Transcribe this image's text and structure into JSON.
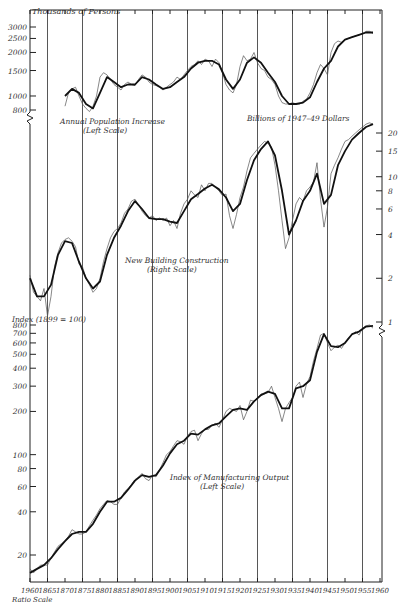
{
  "chart_data": {
    "type": "line",
    "title": "",
    "xlabel": "",
    "x_scale_note": "Ratio Scale",
    "x_ticks": [
      "1960",
      "1865",
      "1870",
      "1875",
      "1880",
      "1885",
      "1890",
      "1895",
      "1900",
      "1905",
      "1910",
      "1915",
      "1920",
      "1925",
      "1930",
      "1935",
      "1940",
      "1945",
      "1950",
      "1955",
      "1960"
    ],
    "xlim": [
      1860,
      1960
    ],
    "panels": [
      {
        "name": "Annual Population Increase",
        "label": "Annual Population Increase",
        "scale_note": "(Left Scale)",
        "axis": "left-top",
        "ylabel": "Thousands of Persons",
        "yscale": "log",
        "y_ticks": [
          "3000",
          "2500",
          "2000",
          "1500",
          "1000",
          "800"
        ],
        "series": [
          {
            "name": "annual",
            "x": [
              1870,
              1871,
              1872,
              1873,
              1874,
              1875,
              1876,
              1877,
              1878,
              1879,
              1880,
              1881,
              1882,
              1883,
              1884,
              1885,
              1886,
              1887,
              1888,
              1889,
              1890,
              1891,
              1892,
              1893,
              1894,
              1895,
              1896,
              1897,
              1898,
              1899,
              1900,
              1901,
              1902,
              1903,
              1904,
              1905,
              1906,
              1907,
              1908,
              1909,
              1910,
              1911,
              1912,
              1913,
              1914,
              1915,
              1916,
              1917,
              1918,
              1919,
              1920,
              1921,
              1922,
              1923,
              1924,
              1925,
              1926,
              1927,
              1928,
              1929,
              1930,
              1931,
              1932,
              1933,
              1934,
              1935,
              1936,
              1937,
              1938,
              1939,
              1940,
              1941,
              1942,
              1943,
              1944,
              1945,
              1946,
              1947,
              1948,
              1949,
              1950,
              1951,
              1952,
              1953,
              1954,
              1955,
              1956,
              1957,
              1958
            ],
            "values": [
              850,
              1050,
              1120,
              1150,
              1000,
              880,
              820,
              780,
              850,
              1000,
              1350,
              1450,
              1400,
              1300,
              1200,
              1150,
              1100,
              1200,
              1250,
              1200,
              1180,
              1300,
              1400,
              1350,
              1250,
              1200,
              1180,
              1150,
              1100,
              1150,
              1200,
              1250,
              1350,
              1300,
              1400,
              1500,
              1600,
              1650,
              1750,
              1650,
              1800,
              1750,
              1600,
              1800,
              1700,
              1450,
              1200,
              1100,
              1050,
              1200,
              1600,
              1900,
              1750,
              1800,
              2000,
              1700,
              1550,
              1500,
              1350,
              1300,
              1200,
              1000,
              900,
              880,
              880,
              900,
              880,
              880,
              920,
              950,
              1050,
              1200,
              1450,
              1650,
              1550,
              1400,
              2000,
              2300,
              2400,
              2350,
              2450,
              2500,
              2550,
              2600,
              2650,
              2700,
              2800,
              2800,
              2700
            ]
          },
          {
            "name": "smoothed",
            "x": [
              1870,
              1872,
              1874,
              1876,
              1878,
              1880,
              1882,
              1884,
              1886,
              1888,
              1890,
              1892,
              1894,
              1896,
              1898,
              1900,
              1902,
              1904,
              1906,
              1908,
              1910,
              1912,
              1914,
              1916,
              1918,
              1920,
              1922,
              1924,
              1926,
              1928,
              1930,
              1932,
              1934,
              1936,
              1938,
              1940,
              1942,
              1944,
              1946,
              1948,
              1950,
              1952,
              1954,
              1956,
              1958
            ],
            "values": [
              1000,
              1120,
              1050,
              880,
              820,
              1050,
              1350,
              1250,
              1150,
              1200,
              1200,
              1350,
              1300,
              1200,
              1120,
              1150,
              1250,
              1350,
              1550,
              1700,
              1750,
              1750,
              1650,
              1300,
              1120,
              1300,
              1700,
              1850,
              1700,
              1450,
              1250,
              1000,
              880,
              880,
              900,
              980,
              1250,
              1550,
              1750,
              2200,
              2450,
              2550,
              2650,
              2750,
              2750
            ]
          }
        ]
      },
      {
        "name": "New Building Construction",
        "label": "New Building Construction",
        "scale_note": "(Right Scale)",
        "axis": "right",
        "ylabel": "Billions of 1947–49 Dollars",
        "yscale": "log",
        "y_ticks": [
          "20",
          "15",
          "10",
          "8",
          "6",
          "4",
          "2",
          "1"
        ],
        "series": [
          {
            "name": "annual",
            "x": [
              1860,
              1861,
              1862,
              1863,
              1864,
              1865,
              1866,
              1867,
              1868,
              1869,
              1870,
              1871,
              1872,
              1873,
              1874,
              1875,
              1876,
              1877,
              1878,
              1879,
              1880,
              1881,
              1882,
              1883,
              1884,
              1885,
              1886,
              1887,
              1888,
              1889,
              1890,
              1891,
              1892,
              1893,
              1894,
              1895,
              1896,
              1897,
              1898,
              1899,
              1900,
              1901,
              1902,
              1903,
              1904,
              1905,
              1906,
              1907,
              1908,
              1909,
              1910,
              1911,
              1912,
              1913,
              1914,
              1915,
              1916,
              1917,
              1918,
              1919,
              1920,
              1921,
              1922,
              1923,
              1924,
              1925,
              1926,
              1927,
              1928,
              1929,
              1930,
              1931,
              1932,
              1933,
              1934,
              1935,
              1936,
              1937,
              1938,
              1939,
              1940,
              1941,
              1942,
              1943,
              1944,
              1945,
              1946,
              1947,
              1948,
              1949,
              1950,
              1951,
              1952,
              1953,
              1954,
              1955,
              1956,
              1957,
              1958
            ],
            "values": [
              2.1,
              1.6,
              1.5,
              1.4,
              1.7,
              1.1,
              1.5,
              2.4,
              3.0,
              3.5,
              3.7,
              3.8,
              3.6,
              3.3,
              2.5,
              2.4,
              2.0,
              1.8,
              1.6,
              1.7,
              2.0,
              2.6,
              3.2,
              3.8,
              4.2,
              4.4,
              4.8,
              5.6,
              6.0,
              6.8,
              7.0,
              6.4,
              5.8,
              5.4,
              5.2,
              5.4,
              5.0,
              5.2,
              5.0,
              5.2,
              4.6,
              5.0,
              4.4,
              5.6,
              6.5,
              7.0,
              8.0,
              7.5,
              7.2,
              8.8,
              8.0,
              9.0,
              9.0,
              8.4,
              8.0,
              7.4,
              7.6,
              5.4,
              4.4,
              5.5,
              7.2,
              8.5,
              11,
              13.5,
              14.5,
              15.5,
              16.5,
              17.5,
              17,
              16,
              12,
              8.0,
              5.0,
              3.2,
              3.8,
              5.0,
              6.5,
              7.2,
              6.8,
              8.0,
              8.5,
              9.2,
              12.5,
              7.0,
              4.5,
              6.2,
              10.5,
              12,
              13.5,
              15.5,
              17.5,
              18,
              19,
              20,
              21,
              22,
              23,
              23.5,
              23
            ]
          },
          {
            "name": "smoothed",
            "x": [
              1860,
              1862,
              1864,
              1866,
              1868,
              1870,
              1872,
              1874,
              1876,
              1878,
              1880,
              1882,
              1884,
              1886,
              1888,
              1890,
              1892,
              1894,
              1896,
              1898,
              1900,
              1902,
              1904,
              1906,
              1908,
              1910,
              1912,
              1914,
              1916,
              1918,
              1920,
              1922,
              1924,
              1926,
              1928,
              1930,
              1932,
              1934,
              1936,
              1938,
              1940,
              1942,
              1944,
              1946,
              1948,
              1950,
              1952,
              1954,
              1956,
              1958
            ],
            "values": [
              2.0,
              1.5,
              1.5,
              1.8,
              2.9,
              3.6,
              3.5,
              2.6,
              2.0,
              1.7,
              1.9,
              2.9,
              3.8,
              4.6,
              5.8,
              6.8,
              6.0,
              5.2,
              5.1,
              5.1,
              4.9,
              4.8,
              5.8,
              7.0,
              7.6,
              8.3,
              8.8,
              8.2,
              7.2,
              5.8,
              6.5,
              9.5,
              13,
              15.5,
              17.5,
              14,
              8,
              4.0,
              5.0,
              6.8,
              8,
              10.5,
              6.5,
              7.5,
              12,
              15,
              18,
              20,
              22,
              23
            ]
          }
        ]
      },
      {
        "name": "Index of Manufacturing Output",
        "label": "Index of Manufacturing Output",
        "scale_note": "(Left Scale)",
        "axis": "left-bottom",
        "ylabel": "Index (1899 = 100)",
        "yscale": "log",
        "y_ticks": [
          "800",
          "700",
          "600",
          "500",
          "400",
          "300",
          "200",
          "100",
          "80",
          "60",
          "40",
          "20"
        ],
        "series": [
          {
            "name": "annual",
            "x": [
              1860,
              1861,
              1862,
              1863,
              1864,
              1865,
              1866,
              1867,
              1868,
              1869,
              1870,
              1871,
              1872,
              1873,
              1874,
              1875,
              1876,
              1877,
              1878,
              1879,
              1880,
              1881,
              1882,
              1883,
              1884,
              1885,
              1886,
              1887,
              1888,
              1889,
              1890,
              1891,
              1892,
              1893,
              1894,
              1895,
              1896,
              1897,
              1898,
              1899,
              1900,
              1901,
              1902,
              1903,
              1904,
              1905,
              1906,
              1907,
              1908,
              1909,
              1910,
              1911,
              1912,
              1913,
              1914,
              1915,
              1916,
              1917,
              1918,
              1919,
              1920,
              1921,
              1922,
              1923,
              1924,
              1925,
              1926,
              1927,
              1928,
              1929,
              1930,
              1931,
              1932,
              1933,
              1934,
              1935,
              1936,
              1937,
              1938,
              1939,
              1940,
              1941,
              1942,
              1943,
              1944,
              1945,
              1946,
              1947,
              1948,
              1949,
              1950,
              1951,
              1952,
              1953,
              1954,
              1955,
              1956,
              1957,
              1958
            ],
            "values": [
              16,
              15,
              16,
              17,
              17,
              17,
              19,
              21,
              23,
              24,
              25,
              27,
              30,
              29,
              28,
              28,
              29,
              32,
              35,
              38,
              42,
              45,
              48,
              47,
              45,
              45,
              50,
              55,
              58,
              62,
              67,
              70,
              74,
              68,
              66,
              72,
              70,
              78,
              88,
              100,
              105,
              115,
              125,
              123,
              118,
              135,
              145,
              148,
              125,
              140,
              150,
              150,
              160,
              165,
              155,
              175,
              200,
              210,
              205,
              200,
              220,
              175,
              200,
              240,
              235,
              250,
              265,
              265,
              270,
              300,
              250,
              210,
              170,
              210,
              230,
              250,
              300,
              320,
              250,
              310,
              350,
              450,
              550,
              680,
              700,
              600,
              530,
              560,
              580,
              550,
              600,
              650,
              680,
              720,
              680,
              760,
              790,
              800,
              760
            ]
          },
          {
            "name": "smoothed",
            "x": [
              1860,
              1862,
              1864,
              1866,
              1868,
              1870,
              1872,
              1874,
              1876,
              1878,
              1880,
              1882,
              1884,
              1886,
              1888,
              1890,
              1892,
              1894,
              1896,
              1898,
              1900,
              1902,
              1904,
              1906,
              1908,
              1910,
              1912,
              1914,
              1916,
              1918,
              1920,
              1922,
              1924,
              1926,
              1928,
              1930,
              1932,
              1934,
              1936,
              1938,
              1940,
              1942,
              1944,
              1946,
              1948,
              1950,
              1952,
              1954,
              1956,
              1958
            ],
            "values": [
              15,
              16,
              17,
              19,
              22,
              25,
              28,
              29,
              29,
              33,
              40,
              47,
              47,
              50,
              57,
              66,
              72,
              70,
              72,
              84,
              102,
              118,
              125,
              140,
              138,
              150,
              160,
              165,
              185,
              205,
              210,
              205,
              235,
              260,
              275,
              265,
              210,
              210,
              290,
              300,
              330,
              520,
              690,
              570,
              560,
              600,
              690,
              720,
              780,
              790
            ]
          }
        ]
      }
    ]
  },
  "labels": {
    "population_label": "Annual Population Increase",
    "population_scale": "(Left Scale)",
    "population_unit": "Thousands of Persons",
    "building_label": "New Building Construction",
    "building_scale": "(Right Scale)",
    "building_unit": "Billions of 1947–49 Dollars",
    "manufacturing_label": "Index of Manufacturing Output",
    "manufacturing_scale": "(Left Scale)",
    "manufacturing_unit": "Index (1899 = 100)",
    "ratio_scale": "Ratio Scale"
  }
}
